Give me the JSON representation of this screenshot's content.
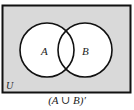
{
  "diagram": {
    "type": "venn",
    "universe_label": "U",
    "sets": [
      {
        "label": "A",
        "cx": 47,
        "cy": 50,
        "r": 27
      },
      {
        "label": "B",
        "cx": 85,
        "cy": 50,
        "r": 27
      }
    ],
    "shaded_region": "outside A and B",
    "caption": "(A ∪ B)′",
    "colors": {
      "shade": "#d9d9d9",
      "circle_fill": "#ffffff",
      "stroke": "#111111"
    }
  }
}
